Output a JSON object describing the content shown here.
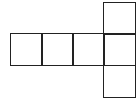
{
  "diagram": {
    "type": "cube-net",
    "line_color": "#222222",
    "background": "#ffffff",
    "cell_size": 32,
    "squares": [
      {
        "id": "row-1",
        "x": 10,
        "y": 33
      },
      {
        "id": "row-2",
        "x": 41,
        "y": 33
      },
      {
        "id": "row-3",
        "x": 72,
        "y": 33
      },
      {
        "id": "row-4",
        "x": 103,
        "y": 33
      },
      {
        "id": "top",
        "x": 103,
        "y": 2
      },
      {
        "id": "bottom",
        "x": 103,
        "y": 65
      }
    ]
  }
}
